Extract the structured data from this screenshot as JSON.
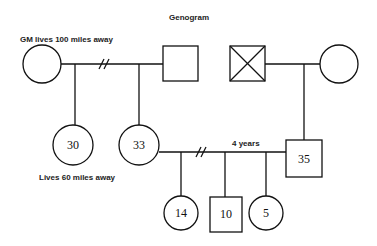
{
  "title": "Genogram",
  "annotations": {
    "gm_note": "GM lives 100 miles away",
    "child30_note": "Lives 60 miles away",
    "marriage_duration": "4 years"
  },
  "people": {
    "grandmother": {
      "shape": "circle",
      "label": ""
    },
    "grandfather": {
      "shape": "square",
      "label": ""
    },
    "deceased_male": {
      "shape": "square-x",
      "label": ""
    },
    "paternal_female": {
      "shape": "circle",
      "label": ""
    },
    "daughter_30": {
      "shape": "circle",
      "label": "30"
    },
    "daughter_33": {
      "shape": "circle",
      "label": "33"
    },
    "husband_35": {
      "shape": "square",
      "label": "35"
    },
    "child_14": {
      "shape": "circle",
      "label": "14"
    },
    "child_10": {
      "shape": "square",
      "label": "10"
    },
    "child_5": {
      "shape": "circle",
      "label": "5"
    }
  },
  "relationships": [
    {
      "from": "grandmother",
      "to": "grandfather",
      "type": "divorced"
    },
    {
      "from": "deceased_male",
      "to": "paternal_female",
      "type": "married"
    },
    {
      "from": "daughter_33",
      "to": "husband_35",
      "type": "divorced",
      "note": "4 years"
    }
  ]
}
